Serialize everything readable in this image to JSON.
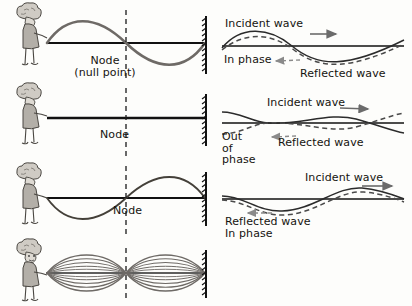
{
  "diagram": {
    "colors": {
      "rope_line": "#111111",
      "wave_curve": "#6e6a66",
      "wave_curve_dark": "#2b2b2b",
      "dashed_wave": "#4a4a4a",
      "node_dashed_line": "#1a1a1a",
      "person_fill": "#b3afa8",
      "person_outline": "#4a4742",
      "background": "#fdfdfb",
      "arrow": "#6b6b6b"
    },
    "panels": [
      {
        "id": "panel-1",
        "left": {
          "wave_type": "full-sine-one-wavelength",
          "node_label_line_1": "Node",
          "node_label_line_2": "(null point)",
          "has_dashed_node_line": true,
          "has_wall": true,
          "has_person": true
        },
        "right": {
          "incident_label": "Incident wave",
          "reflected_label": "Reflected wave",
          "phase_label": "In phase"
        }
      },
      {
        "id": "panel-2",
        "left": {
          "wave_type": "flat-line-cancellation",
          "node_label_line_1": "Node",
          "node_label_line_2": "",
          "has_dashed_node_line": true,
          "has_wall": true,
          "has_person": true
        },
        "right": {
          "incident_label": "Incident wave",
          "reflected_label": "Reflected wave",
          "phase_label": "Out of phase"
        }
      },
      {
        "id": "panel-3",
        "left": {
          "wave_type": "inverted-sine-one-wavelength",
          "node_label_line_1": "Node",
          "node_label_line_2": "",
          "has_dashed_node_line": true,
          "has_wall": true,
          "has_person": true
        },
        "right": {
          "incident_label": "Incident wave",
          "reflected_label": "Reflected wave",
          "phase_label": "In phase"
        }
      },
      {
        "id": "panel-4",
        "left": {
          "wave_type": "standing-wave-envelope-two-loops",
          "node_label_line_1": "",
          "node_label_line_2": "",
          "has_dashed_node_line": true,
          "has_wall": true,
          "has_person": true
        },
        "right": {
          "incident_label": "",
          "reflected_label": "",
          "phase_label": ""
        }
      }
    ]
  }
}
